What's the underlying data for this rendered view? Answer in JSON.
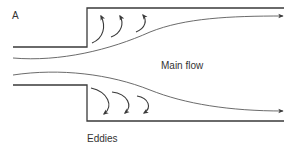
{
  "figure": {
    "panel_label": "A",
    "labels": {
      "main_flow": "Main flow",
      "eddies": "Eddies"
    },
    "upper_eddy_count": 3,
    "lower_eddy_count": 3,
    "colors": {
      "line": "#3a3a3a",
      "text": "#333333",
      "background": "#ffffff"
    }
  }
}
